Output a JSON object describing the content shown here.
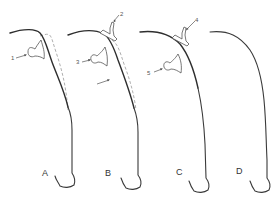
{
  "figure": {
    "panels": [
      {
        "label": "A",
        "callouts": [
          {
            "number": "1"
          }
        ]
      },
      {
        "label": "B",
        "callouts": [
          {
            "number": "2"
          },
          {
            "number": "3"
          }
        ]
      },
      {
        "label": "C",
        "callouts": [
          {
            "number": "4"
          },
          {
            "number": "5"
          }
        ]
      },
      {
        "label": "D",
        "callouts": []
      }
    ]
  },
  "colors": {
    "line": "#3a3a3a",
    "dashed": "#9a9a9a",
    "background": "#ffffff"
  }
}
